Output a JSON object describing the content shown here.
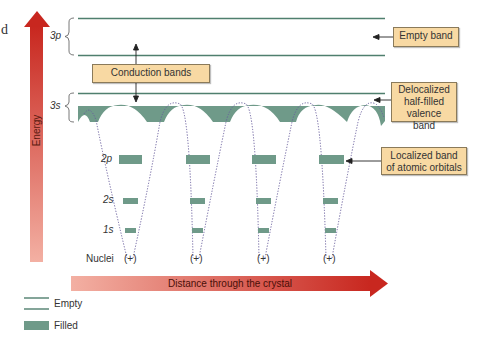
{
  "figure": {
    "stray_char": "d",
    "energy_axis_label": "Energy",
    "distance_axis_label": "Distance through the crystal",
    "nuclei_label": "Nuclei",
    "nucleus_symbol": "(+)",
    "orbitals": {
      "p3": "3p",
      "s3": "3s",
      "p2": "2p",
      "s2": "2s",
      "s1": "1s"
    },
    "callouts": {
      "conduction": "Conduction bands",
      "empty_band": "Empty band",
      "valence_line1": "Delocalized",
      "valence_line2": "half-filled",
      "valence_line3": "valence band",
      "localized_line1": "Localized band",
      "localized_line2": "of atomic orbitals"
    },
    "legend": {
      "empty": "Empty",
      "filled": "Filled"
    },
    "colors": {
      "band": "#6f9a89",
      "line": "#4f7f6e",
      "callout_bg": "#f8d9a3",
      "arrow_dark": "#c8271f",
      "arrow_light": "#f3b3a6"
    },
    "nuclei_count": 4
  }
}
